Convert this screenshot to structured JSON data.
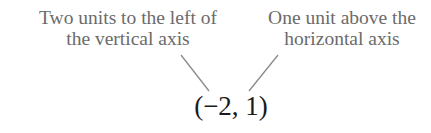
{
  "annotations": {
    "left": {
      "line1": "Two units to the left of",
      "line2": "the vertical axis"
    },
    "right": {
      "line1": "One unit above the",
      "line2": "horizontal axis"
    }
  },
  "point": {
    "label": "(−2, 1)",
    "x": -2,
    "y": 1
  },
  "colors": {
    "annotation_text": "#6b6b6b",
    "leader_line": "#8a8a8a",
    "point_text": "#1a1a1a"
  }
}
